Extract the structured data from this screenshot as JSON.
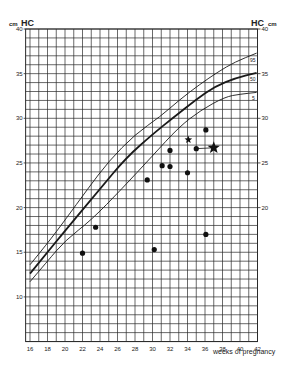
{
  "chart_data": {
    "type": "scatter",
    "title": "",
    "ylabel_left": "HC",
    "ylabel_right": "HC",
    "yunit": "cm",
    "xlabel": "weeks of pregnancy",
    "xlim": [
      15.5,
      42
    ],
    "ylim": [
      5,
      40
    ],
    "grid": true,
    "x_ticks": [
      16,
      18,
      20,
      22,
      24,
      26,
      28,
      30,
      32,
      34,
      36,
      38,
      40,
      42
    ],
    "y_ticks_left": [
      10,
      15,
      20,
      25,
      30,
      35,
      40
    ],
    "y_ticks_right": [
      20,
      25,
      30,
      35,
      40
    ],
    "percentile_curves": [
      {
        "name": "95",
        "style": "thin",
        "x": [
          16,
          18,
          20,
          22.6,
          25,
          28,
          30.9,
          33,
          35.4,
          37.5,
          39.4,
          41.9
        ],
        "y": [
          13.6,
          16.0,
          18.6,
          22.1,
          25.2,
          28.2,
          30.2,
          32.0,
          33.8,
          35.2,
          36.3,
          37.3
        ]
      },
      {
        "name": "50",
        "style": "bold",
        "x": [
          16,
          18,
          20,
          24,
          27,
          30,
          32.4,
          35,
          37.2,
          39.5,
          41.9
        ],
        "y": [
          12.6,
          15.0,
          17.4,
          22.1,
          25.6,
          28.2,
          30.1,
          32.1,
          33.6,
          34.5,
          35.1
        ]
      },
      {
        "name": "5",
        "style": "thin",
        "x": [
          16,
          18,
          20,
          23,
          26.5,
          30,
          33,
          35.5,
          38.3,
          40,
          41.9
        ],
        "y": [
          11.7,
          14.0,
          16.3,
          18.6,
          22.1,
          25.8,
          29.0,
          30.9,
          32.4,
          32.7,
          32.9
        ]
      }
    ],
    "series": [
      {
        "name": "measurements",
        "marker": "dot",
        "points": [
          {
            "x": 22.0,
            "y": 14.9
          },
          {
            "x": 23.5,
            "y": 17.8
          },
          {
            "x": 29.4,
            "y": 23.1
          },
          {
            "x": 30.2,
            "y": 15.3
          },
          {
            "x": 31.1,
            "y": 24.7
          },
          {
            "x": 32.0,
            "y": 24.6
          },
          {
            "x": 32.0,
            "y": 26.4
          },
          {
            "x": 34.0,
            "y": 23.9
          },
          {
            "x": 35.0,
            "y": 26.6
          },
          {
            "x": 36.1,
            "y": 28.7
          },
          {
            "x": 36.1,
            "y": 17.0
          }
        ]
      },
      {
        "name": "star-small",
        "marker": "star-small",
        "points": [
          {
            "x": 34.1,
            "y": 27.6
          }
        ]
      },
      {
        "name": "star-large",
        "marker": "star-large",
        "points": [
          {
            "x": 37.0,
            "y": 26.7
          }
        ]
      }
    ],
    "connectors": [
      {
        "from": {
          "x": 35.0,
          "y": 26.6
        },
        "to": {
          "x": 37.0,
          "y": 26.7
        }
      }
    ]
  },
  "labels": {
    "left_unit": "cm",
    "left_title": "HC",
    "right_title": "HC",
    "right_unit": "cm",
    "xlabel": "weeks of pregnancy",
    "curve_95": "95",
    "curve_50": "50",
    "curve_5": "5"
  },
  "colors": {
    "grid": "#2a2a2a",
    "curve": "#1a1a1a",
    "marker": "#111111",
    "background": "#ffffff"
  }
}
